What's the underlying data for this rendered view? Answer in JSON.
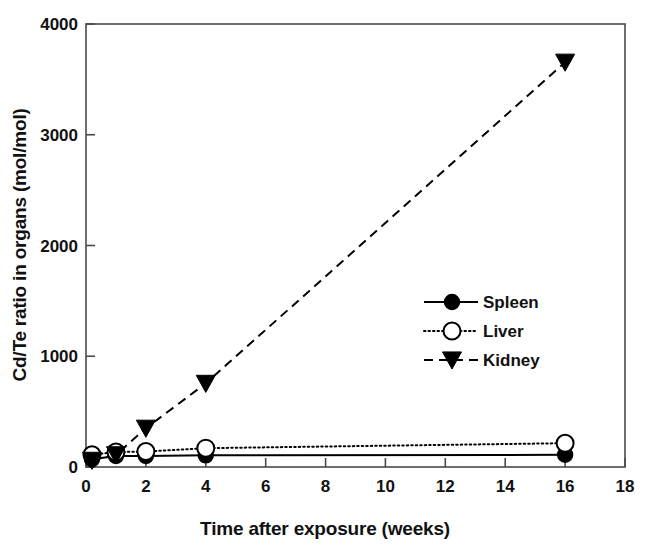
{
  "chart_data": {
    "type": "line",
    "title": "",
    "xlabel": "Time after exposure (weeks)",
    "ylabel": "Cd/Te ratio in organs (mol/mol)",
    "xlim": [
      0,
      18
    ],
    "ylim": [
      0,
      4000
    ],
    "xticks": [
      0,
      2,
      4,
      6,
      8,
      10,
      12,
      14,
      16,
      18
    ],
    "yticks": [
      0,
      1000,
      2000,
      3000,
      4000
    ],
    "xtick_labels": [
      "0",
      "2",
      "4",
      "6",
      "8",
      "10",
      "12",
      "14",
      "16",
      "18"
    ],
    "ytick_labels": [
      "0",
      "1000",
      "2000",
      "3000",
      "4000"
    ],
    "grid": false,
    "legend_position": "center-right",
    "series": [
      {
        "name": "Spleen",
        "marker": "filled-circle",
        "line_style": "solid",
        "color": "#000000",
        "x": [
          0.2,
          1,
          2,
          4,
          16
        ],
        "values": [
          70,
          100,
          100,
          105,
          110
        ]
      },
      {
        "name": "Liver",
        "marker": "open-circle",
        "line_style": "dotted",
        "color": "#000000",
        "x": [
          0.2,
          1,
          2,
          4,
          16
        ],
        "values": [
          110,
          135,
          140,
          170,
          215
        ]
      },
      {
        "name": "Kidney",
        "marker": "filled-triangle-down",
        "line_style": "dashed",
        "color": "#000000",
        "x": [
          0.2,
          1,
          2,
          4,
          16
        ],
        "values": [
          60,
          110,
          350,
          755,
          3655
        ]
      }
    ]
  },
  "legend": {
    "items": [
      {
        "label": "Spleen",
        "marker": "filled-circle",
        "line_style": "solid"
      },
      {
        "label": "Liver",
        "marker": "open-circle",
        "line_style": "dotted"
      },
      {
        "label": "Kidney",
        "marker": "filled-triangle-down",
        "line_style": "dashed"
      }
    ]
  },
  "axes": {
    "x_title": "Time after exposure (weeks)",
    "y_title": "Cd/Te ratio in organs (mol/mol)"
  }
}
